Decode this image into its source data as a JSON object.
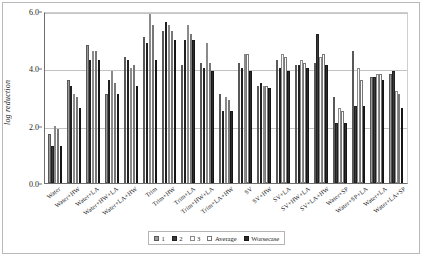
{
  "chart_data": {
    "type": "bar",
    "title": "",
    "xlabel": "",
    "ylabel": "log reduction",
    "ylim": [
      0.0,
      6.0
    ],
    "yticks": [
      "0.0",
      "2.0",
      "4.0",
      "6.0"
    ],
    "ytick_values": [
      0.0,
      2.0,
      4.0,
      6.0
    ],
    "grid": true,
    "legend_position": "bottom-center",
    "categories": [
      "Water",
      "Water+HW",
      "Water+LA",
      "Water+HW+LA",
      "Water+LA+HW",
      "Trim",
      "Trim+HW",
      "Trim+LA",
      "Trim+HW+LA",
      "Trim+LA+HW",
      "SV",
      "SV+HW",
      "SV+LA",
      "SV+HW+LA",
      "SV+LA+HW",
      "Water+SP",
      "Water+SP+LA",
      "Water+LA",
      "Water+LA+SP"
    ],
    "series": [
      {
        "name": "1",
        "color": "#9a9a9a",
        "values": [
          1.7,
          3.6,
          4.8,
          3.1,
          4.4,
          5.1,
          5.3,
          4.1,
          4.2,
          3.1,
          4.2,
          3.4,
          4.3,
          4.1,
          4.2,
          3.0,
          4.6,
          3.7,
          3.8
        ]
      },
      {
        "name": "2",
        "color": "#3a3a3a",
        "values": [
          1.3,
          3.4,
          4.3,
          3.6,
          4.3,
          4.9,
          5.6,
          5.0,
          4.0,
          2.5,
          4.0,
          3.5,
          4.0,
          4.1,
          5.2,
          2.1,
          2.7,
          3.7,
          3.9
        ]
      },
      {
        "name": "3",
        "color": "#fbfbfb",
        "values": [
          2.0,
          3.1,
          4.6,
          3.9,
          4.0,
          5.9,
          5.5,
          5.5,
          4.9,
          3.0,
          4.5,
          3.4,
          4.5,
          4.3,
          4.4,
          2.6,
          4.0,
          3.8,
          3.2
        ]
      },
      {
        "name": "Average",
        "color": "#ffffff",
        "values": [
          1.9,
          3.0,
          4.6,
          3.5,
          4.1,
          5.5,
          5.3,
          5.2,
          4.2,
          2.9,
          4.5,
          3.4,
          4.4,
          4.2,
          4.5,
          2.5,
          3.6,
          3.8,
          3.1
        ]
      },
      {
        "name": "Worsecase",
        "color": "#2b2b2b",
        "values": [
          1.3,
          2.6,
          4.3,
          3.1,
          3.4,
          4.3,
          5.0,
          5.0,
          3.9,
          2.5,
          3.9,
          3.3,
          3.9,
          4.0,
          4.1,
          2.1,
          2.7,
          3.6,
          2.6
        ]
      }
    ]
  }
}
